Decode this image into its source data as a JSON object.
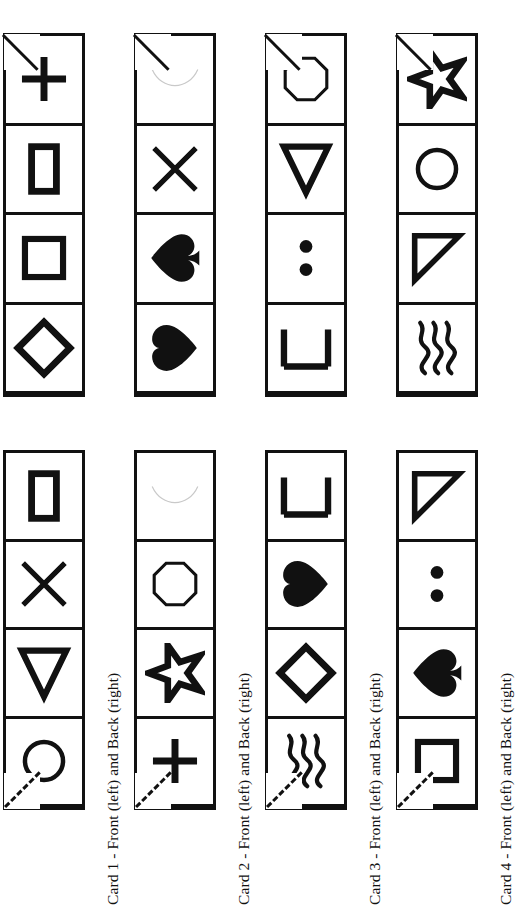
{
  "page": {
    "orientation": "rotated-90",
    "ink_color": "#111111",
    "background_color": "#ffffff"
  },
  "captions": [
    "Card 1 - Front (left) and Back (right)",
    "Card 2 - Front (left) and Back (right)",
    "Card 3 - Front (left) and Back (right)",
    "Card 4 - Front (left) and Back (right)"
  ],
  "cards": [
    {
      "id": "card-1",
      "caption": "Card 1 - Front (left) and Back (right)",
      "back": {
        "label": "Back",
        "symbols": [
          "plus",
          "rectangle-tall",
          "square",
          "diamond"
        ]
      },
      "front": {
        "label": "Front",
        "symbols": [
          "rectangle-tall",
          "cross-x",
          "triangle-left",
          "circle"
        ]
      }
    },
    {
      "id": "card-2",
      "caption": "Card 2 - Front (left) and Back (right)",
      "back": {
        "label": "Back",
        "symbols": [
          "crescent-faint",
          "cross-x",
          "spade",
          "heart"
        ]
      },
      "front": {
        "label": "Front",
        "symbols": [
          "crescent-faint",
          "octagon",
          "star",
          "plus"
        ]
      }
    },
    {
      "id": "card-3",
      "caption": "Card 3 - Front (left) and Back (right)",
      "back": {
        "label": "Back",
        "symbols": [
          "octagon",
          "triangle-left",
          "two-dots",
          "bracket"
        ]
      },
      "front": {
        "label": "Front",
        "symbols": [
          "bracket",
          "heart",
          "diamond",
          "waves"
        ]
      }
    },
    {
      "id": "card-4",
      "caption": "Card 4 - Front (left) and Back (right)",
      "back": {
        "label": "Back",
        "symbols": [
          "star",
          "circle",
          "right-triangle",
          "waves"
        ]
      },
      "front": {
        "label": "Front",
        "symbols": [
          "right-triangle",
          "two-dots",
          "spade",
          "square"
        ]
      }
    }
  ],
  "symbol_names": {
    "plus": "plus-icon",
    "rectangle-tall": "rectangle-icon",
    "square": "square-icon",
    "diamond": "diamond-icon",
    "cross-x": "cross-x-icon",
    "triangle-left": "triangle-left-icon",
    "circle": "circle-icon",
    "crescent-faint": "crescent-icon",
    "spade": "spade-icon",
    "heart": "heart-icon",
    "octagon": "octagon-icon",
    "star": "star-icon",
    "two-dots": "two-dots-icon",
    "bracket": "bracket-icon",
    "waves": "waves-icon",
    "right-triangle": "right-triangle-icon"
  }
}
